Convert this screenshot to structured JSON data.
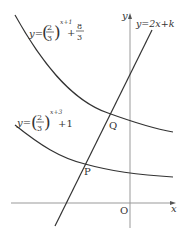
{
  "diagram": {
    "type": "function-graph",
    "axes": {
      "x_label": "x",
      "y_label": "y",
      "origin_label": "O"
    },
    "curves": [
      {
        "id": "upper-curve",
        "label_prefix": "y=",
        "base_num": "2",
        "base_den": "3",
        "exponent": "x+1",
        "plus": "+",
        "const_num": "8",
        "const_den": "3",
        "equation_text": "y=(2/3)^(x+1)+8/3"
      },
      {
        "id": "lower-curve",
        "label_prefix": "y=",
        "base_num": "2",
        "base_den": "3",
        "exponent": "x+3",
        "const": "+1",
        "equation_text": "y=(2/3)^(x+3)+1"
      }
    ],
    "line": {
      "label": "y=2x+k"
    },
    "points": [
      {
        "name": "Q"
      },
      {
        "name": "P"
      }
    ],
    "colors": {
      "stroke": "#333333",
      "axis": "#999999"
    }
  }
}
